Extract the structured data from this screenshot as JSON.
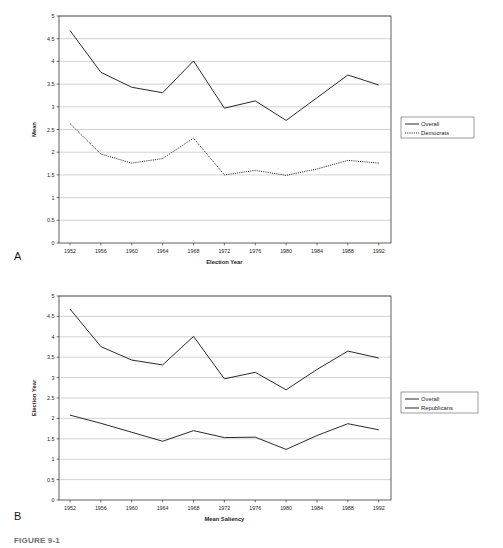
{
  "figure": {
    "caption": "FIGURE 9-1",
    "panel_a_letter": "A",
    "panel_b_letter": "B"
  },
  "chart_data": [
    {
      "type": "line",
      "panel": "A",
      "title": "",
      "xlabel": "Election Year",
      "ylabel": "Mean",
      "categories": [
        "1952",
        "1956",
        "1960",
        "1964",
        "1968",
        "1972",
        "1976",
        "1980",
        "1984",
        "1988",
        "1992"
      ],
      "x": [
        1952,
        1956,
        1960,
        1964,
        1968,
        1972,
        1976,
        1980,
        1984,
        1988,
        1992
      ],
      "ylim": [
        0,
        5
      ],
      "yticks": [
        0,
        0.5,
        1,
        1.5,
        2,
        2.5,
        3,
        3.5,
        4,
        4.5,
        5
      ],
      "ytick_labels": [
        "0",
        "0.5",
        "1",
        "1.5",
        "2",
        "2.5",
        "3",
        "3.5",
        "4",
        "4.5",
        "5"
      ],
      "grid": true,
      "legend_position": "right",
      "series": [
        {
          "name": "Overall",
          "style": "solid",
          "values": [
            4.68,
            3.76,
            3.43,
            3.31,
            4.01,
            2.97,
            3.13,
            2.7,
            3.2,
            3.7,
            3.48
          ]
        },
        {
          "name": "Democrats",
          "style": "dotted",
          "values": [
            2.63,
            1.96,
            1.76,
            1.86,
            2.31,
            1.5,
            1.6,
            1.49,
            1.63,
            1.82,
            1.76
          ]
        }
      ]
    },
    {
      "type": "line",
      "panel": "B",
      "title": "",
      "xlabel": "Mean Saliency",
      "ylabel": "Election Year",
      "categories": [
        "1952",
        "1956",
        "1960",
        "1964",
        "1968",
        "1972",
        "1976",
        "1980",
        "1984",
        "1988",
        "1992"
      ],
      "x": [
        1952,
        1956,
        1960,
        1964,
        1968,
        1972,
        1976,
        1980,
        1984,
        1988,
        1992
      ],
      "ylim": [
        0,
        5
      ],
      "yticks": [
        0,
        0.5,
        1,
        1.5,
        2,
        2.5,
        3,
        3.5,
        4,
        4.5,
        5
      ],
      "ytick_labels": [
        "0",
        "0.5",
        "1",
        "1.5",
        "2",
        "2.5",
        "3",
        "3.5",
        "4",
        "4.5",
        "5"
      ],
      "grid": true,
      "legend_position": "right",
      "series": [
        {
          "name": "Overall",
          "style": "solid",
          "values": [
            4.68,
            3.76,
            3.43,
            3.31,
            4.01,
            2.97,
            3.13,
            2.7,
            3.2,
            3.65,
            3.48
          ]
        },
        {
          "name": "Republicans",
          "style": "solid",
          "values": [
            2.08,
            1.88,
            1.66,
            1.44,
            1.7,
            1.53,
            1.54,
            1.24,
            1.58,
            1.87,
            1.72
          ]
        }
      ]
    }
  ]
}
